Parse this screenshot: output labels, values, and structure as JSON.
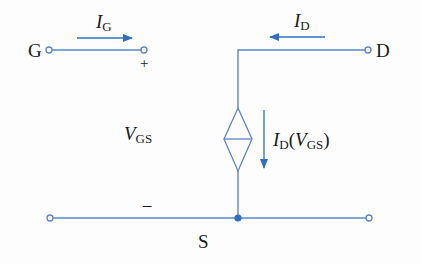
{
  "diagram": {
    "type": "circuit",
    "colors": {
      "wire": "#5b86c4",
      "arrow": "#2f6fc0",
      "text": "#1a1a1a",
      "node": "#2f6fc0"
    },
    "terminals": {
      "gate": {
        "label": "G"
      },
      "drain": {
        "label": "D"
      },
      "source": {
        "label": "S"
      }
    },
    "currents": {
      "gate": {
        "symbol": "I",
        "subscript": "G"
      },
      "drain": {
        "symbol": "I",
        "subscript": "D"
      },
      "source_controlled": {
        "symbol": "I",
        "subscript": "D",
        "open": "(",
        "arg_symbol": "V",
        "arg_subscript": "GS",
        "close": ")"
      }
    },
    "voltage": {
      "symbol": "V",
      "subscript": "GS",
      "plus": "+",
      "minus": "–"
    }
  }
}
